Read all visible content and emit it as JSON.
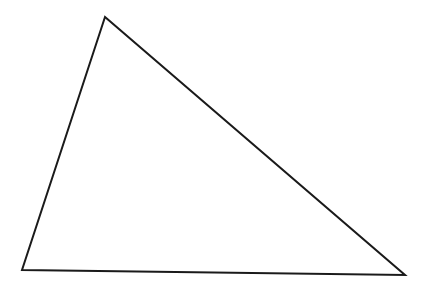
{
  "diagram": {
    "type": "triangle",
    "stroke_color": "#1a1a1a",
    "background": "#ffffff",
    "vertices": [
      {
        "name": "apex",
        "x": 105,
        "y": 17
      },
      {
        "name": "bottom-left",
        "x": 22,
        "y": 270
      },
      {
        "name": "bottom-right",
        "x": 405,
        "y": 275
      }
    ]
  }
}
